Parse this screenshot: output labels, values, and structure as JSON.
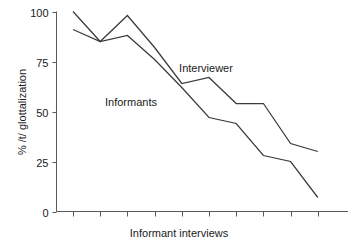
{
  "chart_data": {
    "type": "line",
    "title": "",
    "xlabel": "Informant interviews",
    "ylabel": "% /t/ glottalization",
    "ylim": [
      0,
      100
    ],
    "yticks": [
      0,
      25,
      50,
      75,
      100
    ],
    "ytick_labels": [
      "0",
      "25",
      "50",
      "75",
      "100"
    ],
    "xtick_labels": [
      "",
      "",
      "",
      "",
      "",
      "",
      "",
      "",
      "",
      ""
    ],
    "x": [
      1,
      2,
      3,
      4,
      5,
      6,
      7,
      8,
      9,
      10
    ],
    "grid": false,
    "legend": "inline-annotations",
    "series": [
      {
        "name": "Interviewer",
        "label_text": "Interviewer",
        "values": [
          100,
          85,
          98,
          82,
          64,
          67,
          54,
          54,
          34,
          30
        ]
      },
      {
        "name": "Informants",
        "label_text": "Informants",
        "values": [
          91,
          85,
          88,
          76,
          62,
          47,
          44,
          28,
          25,
          7
        ]
      }
    ],
    "annotations": [
      {
        "text": "Interviewer",
        "x_px": 206,
        "y_px": 72
      },
      {
        "text": "Informants",
        "x_px": 131,
        "y_px": 106
      }
    ],
    "colors": {
      "line": "#3b3b3b",
      "axis": "#5a5a5a",
      "text": "#1a1a1a",
      "background": "#ffffff"
    }
  },
  "axis": {
    "y_title": "% /t/ glottalization",
    "x_title": "Informant interviews"
  }
}
